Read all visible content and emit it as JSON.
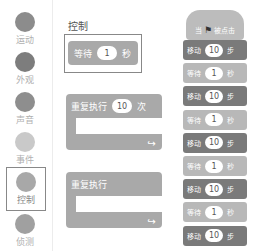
{
  "categories": [
    {
      "label": "运动",
      "color": "#8c8c8c",
      "selected": false
    },
    {
      "label": "外观",
      "color": "#7d7d7d",
      "selected": false
    },
    {
      "label": "声音",
      "color": "#8e8e8e",
      "selected": false
    },
    {
      "label": "事件",
      "color": "#c9c9c9",
      "selected": false
    },
    {
      "label": "控制",
      "color": "#a8a8a8",
      "selected": true
    },
    {
      "label": "侦测",
      "color": "#a0a0a0",
      "selected": false
    }
  ],
  "palette": {
    "title": "控制",
    "wait_block": {
      "prefix": "等待",
      "value": "1",
      "suffix": "秒"
    },
    "repeat_block": {
      "prefix": "重复执行",
      "value": "10",
      "suffix": "次",
      "loop_icon": "↪"
    },
    "forever_block": {
      "label": "重复执行",
      "loop_icon": "↪"
    }
  },
  "script": {
    "hat": {
      "prefix": "当",
      "flag_icon": "⚑",
      "suffix": "被点击"
    },
    "blocks": [
      {
        "type": "move",
        "prefix": "移动",
        "value": "10",
        "suffix": "步"
      },
      {
        "type": "wait",
        "prefix": "等待",
        "value": "1",
        "suffix": "秒"
      },
      {
        "type": "move",
        "prefix": "移动",
        "value": "10",
        "suffix": "步"
      },
      {
        "type": "wait",
        "prefix": "等待",
        "value": "1",
        "suffix": "秒"
      },
      {
        "type": "move",
        "prefix": "移动",
        "value": "10",
        "suffix": "步"
      },
      {
        "type": "wait",
        "prefix": "等待",
        "value": "1",
        "suffix": "秒"
      },
      {
        "type": "move",
        "prefix": "移动",
        "value": "10",
        "suffix": "步"
      },
      {
        "type": "wait",
        "prefix": "等待",
        "value": "1",
        "suffix": "秒"
      },
      {
        "type": "move",
        "prefix": "移动",
        "value": "10",
        "suffix": "步"
      }
    ]
  }
}
